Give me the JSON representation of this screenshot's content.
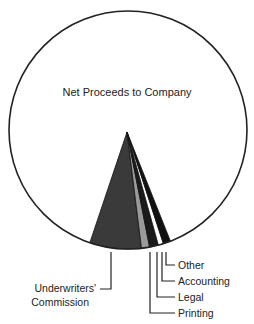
{
  "chart_data": {
    "type": "pie",
    "title": "",
    "categories": [
      "Net Proceeds to Company",
      "Underwriters' Commission",
      "Printing",
      "Legal",
      "Accounting",
      "Other"
    ],
    "values": [
      89.0,
      7.0,
      1.1,
      1.2,
      0.7,
      1.0
    ],
    "unit": "percent (approximate)",
    "colors": [
      "#ffffff",
      "#3a3a3a",
      "#9a9a9a",
      "#1a1a1a",
      "#ffffff",
      "#111111"
    ],
    "labels": {
      "net": "Net Proceeds to Company",
      "underwriters_line1": "Underwriters'",
      "underwriters_line2": "Commission",
      "printing": "Printing",
      "legal": "Legal",
      "accounting": "Accounting",
      "other": "Other"
    },
    "legend": "none (leader-line labels)"
  }
}
